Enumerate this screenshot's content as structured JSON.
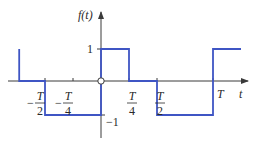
{
  "diagram": {
    "type": "square-wave-signal",
    "function_label": "f(t)",
    "horizontal_axis_label": "t",
    "level_labels": {
      "high": "1",
      "low": "−1"
    },
    "tick_labels": [
      {
        "id": "neg-half",
        "sign": "−",
        "num": "T",
        "den": "2",
        "value_T": -0.5
      },
      {
        "id": "neg-quarter",
        "sign": "−",
        "num": "T",
        "den": "4",
        "value_T": -0.25
      },
      {
        "id": "pos-quarter",
        "sign": "",
        "num": "T",
        "den": "4",
        "value_T": 0.25
      },
      {
        "id": "pos-half",
        "sign": "",
        "num": "T",
        "den": "2",
        "value_T": 0.5
      },
      {
        "id": "period",
        "sign": "",
        "num": "T",
        "den": "",
        "value_T": 1.0
      }
    ],
    "waveform_segments": [
      {
        "t_start_T": -0.73,
        "t_end_T": -0.5,
        "value": 0
      },
      {
        "t_start_T": -0.5,
        "t_end_T": 0,
        "value": -1
      },
      {
        "t_start_T": 0,
        "t_end_T": 0.25,
        "value": 1
      },
      {
        "t_start_T": 0.25,
        "t_end_T": 0.5,
        "value": 0
      },
      {
        "t_start_T": 0.5,
        "t_end_T": 1.0,
        "value": -1
      },
      {
        "t_start_T": 1.0,
        "t_end_T": 1.25,
        "value": 1
      }
    ],
    "leading_edge": {
      "t_T": -0.73,
      "from": 1,
      "to": 0
    },
    "origin_marker": "open-circle",
    "colors": {
      "waveform": "#3f55c4",
      "axes": "#3a3a3a"
    }
  }
}
